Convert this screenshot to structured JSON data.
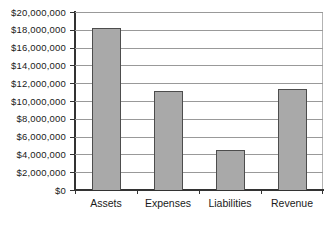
{
  "chart_data": {
    "type": "bar",
    "title": "",
    "categories": [
      "Assets",
      "Expenses",
      "Liabilities",
      "Revenue"
    ],
    "values": [
      18200000,
      11100000,
      4500000,
      11400000
    ],
    "ylim": [
      0,
      20000000
    ],
    "ytick_step": 2000000,
    "ytick_labels": [
      "$0",
      "$2,000,000",
      "$4,000,000",
      "$6,000,000",
      "$8,000,000",
      "$10,000,000",
      "$12,000,000",
      "$14,000,000",
      "$16,000,000",
      "$18,000,000",
      "$20,000,000"
    ],
    "grid": true,
    "legend": "none",
    "colors": {
      "bar_fill": "#a9a9a9",
      "bar_border": "#4d4d4d",
      "gridline": "#999999",
      "axis": "#333333",
      "plot_border": "#b3b3b3",
      "label_text": "#1a1a1a",
      "background": "#ffffff"
    }
  }
}
